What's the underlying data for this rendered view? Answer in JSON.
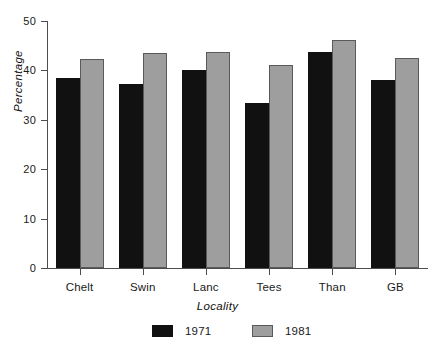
{
  "chart_data": {
    "type": "bar",
    "title": "",
    "subtitle": "",
    "xlabel": "Locality",
    "ylabel": "Percentage",
    "categories": [
      "Chelt",
      "Swin",
      "Lanc",
      "Tees",
      "Than",
      "GB"
    ],
    "series": [
      {
        "name": "1971",
        "color": "#111111",
        "values": [
          38.5,
          37.3,
          40.1,
          33.4,
          43.7,
          38.0
        ]
      },
      {
        "name": "1981",
        "color": "#9e9e9e",
        "values": [
          42.4,
          43.5,
          43.7,
          41.1,
          46.2,
          42.5
        ]
      }
    ],
    "ylim": [
      0,
      50
    ],
    "yticks": [
      0,
      10,
      20,
      30,
      40,
      50
    ],
    "ytick_labels": [
      "0",
      "10",
      "20",
      "30",
      "40",
      "50"
    ],
    "grid": false,
    "legend_position": "bottom",
    "axis_color": "#4d4d4d",
    "background": "#ffffff"
  }
}
